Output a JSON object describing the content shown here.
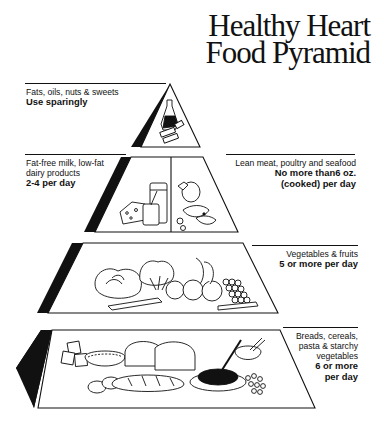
{
  "title": {
    "line1": "Healthy Heart",
    "line2": "Food Pyramid"
  },
  "tiers": [
    {
      "id": "fats",
      "description": "Fats, oils, nuts & sweets",
      "serving": "Use sparingly",
      "icon": "oil-bottle-and-butter-icon",
      "side": "left"
    },
    {
      "id": "dairy",
      "description_lines": [
        "Fat-free milk, low-fat",
        "dairy products"
      ],
      "serving": "2-4 per day",
      "icon": "milk-cheese-yogurt-icon",
      "side": "left"
    },
    {
      "id": "meat",
      "description": "Lean meat, poultry and seafood",
      "serving_lines": [
        "No more than6 oz.",
        "(cooked) per day"
      ],
      "icon": "meat-poultry-fish-icon",
      "side": "right"
    },
    {
      "id": "produce",
      "description": "Vegetables & fruits",
      "serving": "5 or more per day",
      "icon": "vegetables-fruits-icon",
      "side": "right"
    },
    {
      "id": "grains",
      "description_lines": [
        "Breads, cereals,",
        "pasta & starchy",
        "vegetables"
      ],
      "serving_lines": [
        "6 or more",
        "per day"
      ],
      "icon": "breads-pasta-rice-icon",
      "side": "right"
    }
  ],
  "colors": {
    "ink": "#111111",
    "background": "#ffffff",
    "rule": "#222222"
  }
}
